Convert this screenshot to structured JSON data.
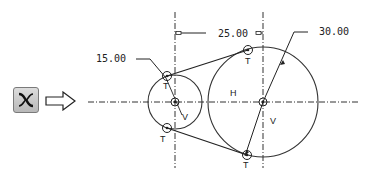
{
  "tool": {
    "icon": "tangent-arc-icon",
    "arrow": "right-arrow-icon"
  },
  "dimensions": {
    "small_radius": "15.00",
    "center_distance": "25.00",
    "large_radius": "30.00"
  },
  "labels": {
    "tangent": "T",
    "vertical": "V",
    "horizontal": "H"
  },
  "colors": {
    "line": "#222222",
    "button_border": "#7a7a7a"
  }
}
